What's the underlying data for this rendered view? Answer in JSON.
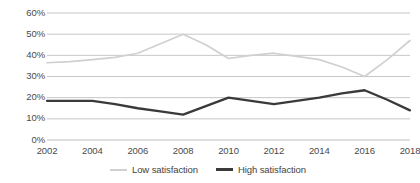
{
  "chart_data": {
    "type": "line",
    "title": "",
    "xlabel": "",
    "ylabel": "",
    "ylim": [
      0,
      60
    ],
    "xlim": [
      2002,
      2018
    ],
    "grid": true,
    "legend_position": "bottom-center",
    "y_ticks": [
      "0%",
      "10%",
      "20%",
      "30%",
      "40%",
      "50%",
      "60%"
    ],
    "y_tick_values": [
      0,
      10,
      20,
      30,
      40,
      50,
      60
    ],
    "x_ticks": [
      "2002",
      "2004",
      "2006",
      "2008",
      "2010",
      "2012",
      "2014",
      "2016",
      "2018"
    ],
    "x_tick_values": [
      2002,
      2004,
      2006,
      2008,
      2010,
      2012,
      2014,
      2016,
      2018
    ],
    "series": [
      {
        "name": "Low satisfaction",
        "color": "#d0d0d0",
        "x": [
          2002,
          2003,
          2004,
          2005,
          2006,
          2007,
          2008,
          2009,
          2010,
          2011,
          2012,
          2013,
          2014,
          2015,
          2016,
          2017,
          2018
        ],
        "values": [
          36.5,
          37.0,
          38.0,
          39.0,
          41.0,
          45.5,
          50.0,
          45.0,
          38.5,
          40.0,
          41.0,
          39.5,
          38.0,
          34.5,
          30.0,
          38.0,
          47.0
        ]
      },
      {
        "name": "High satisfaction",
        "color": "#3a3a3a",
        "x": [
          2002,
          2003,
          2004,
          2005,
          2006,
          2007,
          2008,
          2009,
          2010,
          2011,
          2012,
          2013,
          2014,
          2015,
          2016,
          2017,
          2018
        ],
        "values": [
          18.5,
          18.5,
          18.5,
          17.0,
          15.0,
          13.5,
          12.0,
          16.0,
          20.0,
          18.5,
          17.0,
          18.5,
          20.0,
          22.0,
          23.5,
          19.0,
          14.0
        ]
      }
    ]
  },
  "legend": {
    "items": [
      {
        "label": "Low satisfaction"
      },
      {
        "label": "High satisfaction"
      }
    ]
  }
}
